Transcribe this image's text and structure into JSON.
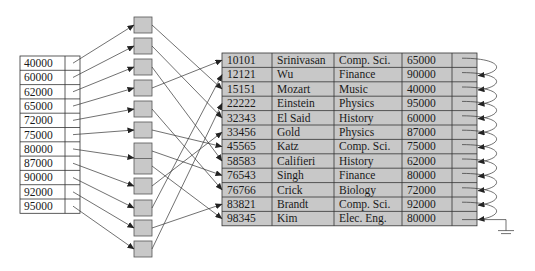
{
  "index": {
    "entries": [
      "40000",
      "60000",
      "62000",
      "65000",
      "72000",
      "75000",
      "80000",
      "87000",
      "90000",
      "92000",
      "95000"
    ]
  },
  "buckets": {
    "count": 11,
    "fill": "#c8c8c8"
  },
  "instructor": {
    "rows": [
      {
        "id": "10101",
        "name": "Srinivasan",
        "dept": "Comp. Sci.",
        "salary": "65000"
      },
      {
        "id": "12121",
        "name": "Wu",
        "dept": "Finance",
        "salary": "90000"
      },
      {
        "id": "15151",
        "name": "Mozart",
        "dept": "Music",
        "salary": "40000"
      },
      {
        "id": "22222",
        "name": "Einstein",
        "dept": "Physics",
        "salary": "95000"
      },
      {
        "id": "32343",
        "name": "El Said",
        "dept": "History",
        "salary": "60000"
      },
      {
        "id": "33456",
        "name": "Gold",
        "dept": "Physics",
        "salary": "87000"
      },
      {
        "id": "45565",
        "name": "Katz",
        "dept": "Comp. Sci.",
        "salary": "75000"
      },
      {
        "id": "58583",
        "name": "Califieri",
        "dept": "History",
        "salary": "62000"
      },
      {
        "id": "76543",
        "name": "Singh",
        "dept": "Finance",
        "salary": "80000"
      },
      {
        "id": "76766",
        "name": "Crick",
        "dept": "Biology",
        "salary": "72000"
      },
      {
        "id": "83821",
        "name": "Brandt",
        "dept": "Comp. Sci.",
        "salary": "92000"
      },
      {
        "id": "98345",
        "name": "Kim",
        "dept": "Elec. Eng.",
        "salary": "80000"
      }
    ],
    "fill": "#c8c8c8"
  }
}
